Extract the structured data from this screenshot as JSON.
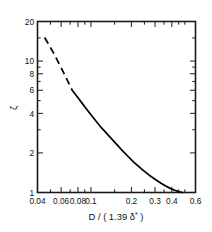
{
  "chart_data": {
    "type": "line",
    "title": "",
    "xlabel": "D / ( 1.39 δ* )",
    "xlabel_parts": {
      "main": "D / ( 1.39 ",
      "symbol": "δ",
      "superscript": "*",
      "close": " )"
    },
    "ylabel": "ζ",
    "xscale": "log",
    "yscale": "log",
    "xlim": [
      0.04,
      0.6
    ],
    "ylim": [
      1,
      20
    ],
    "grid": false,
    "legend": null,
    "x_tick_labels": [
      "0.04",
      "0.06",
      "0.08",
      "0.1",
      "0.2",
      "0.3",
      "0.4",
      "0.6"
    ],
    "x_tick_values": [
      0.04,
      0.06,
      0.08,
      0.1,
      0.2,
      0.3,
      0.4,
      0.6
    ],
    "x_minor_ticks": [
      0.05,
      0.07,
      0.09,
      0.15,
      0.25,
      0.35,
      0.45,
      0.5
    ],
    "y_tick_labels": [
      "1",
      "2",
      "4",
      "6",
      "8",
      "10",
      "20"
    ],
    "y_tick_values": [
      1,
      2,
      4,
      6,
      8,
      10,
      20
    ],
    "y_minor_ticks": [
      3,
      5,
      7,
      9,
      15
    ],
    "series": [
      {
        "name": "zeta-extrapolated",
        "style": "dashed",
        "x": [
          0.0452,
          0.048,
          0.052,
          0.056,
          0.06,
          0.064,
          0.068,
          0.0725
        ],
        "y": [
          15.1,
          13.6,
          11.8,
          10.2,
          8.9,
          7.8,
          6.85,
          6.0
        ]
      },
      {
        "name": "zeta-measured",
        "style": "solid",
        "x": [
          0.0725,
          0.078,
          0.085,
          0.092,
          0.1,
          0.11,
          0.12,
          0.135,
          0.15,
          0.17,
          0.19,
          0.21,
          0.24,
          0.27,
          0.3,
          0.33,
          0.36,
          0.39,
          0.42,
          0.45,
          0.48
        ],
        "y": [
          6.0,
          5.45,
          4.85,
          4.35,
          3.9,
          3.45,
          3.1,
          2.72,
          2.42,
          2.1,
          1.87,
          1.69,
          1.5,
          1.36,
          1.26,
          1.18,
          1.12,
          1.075,
          1.04,
          1.015,
          1.0
        ]
      }
    ]
  },
  "axes": {
    "x_title": "D / ( 1.39 δ* )",
    "y_title": "ζ"
  }
}
